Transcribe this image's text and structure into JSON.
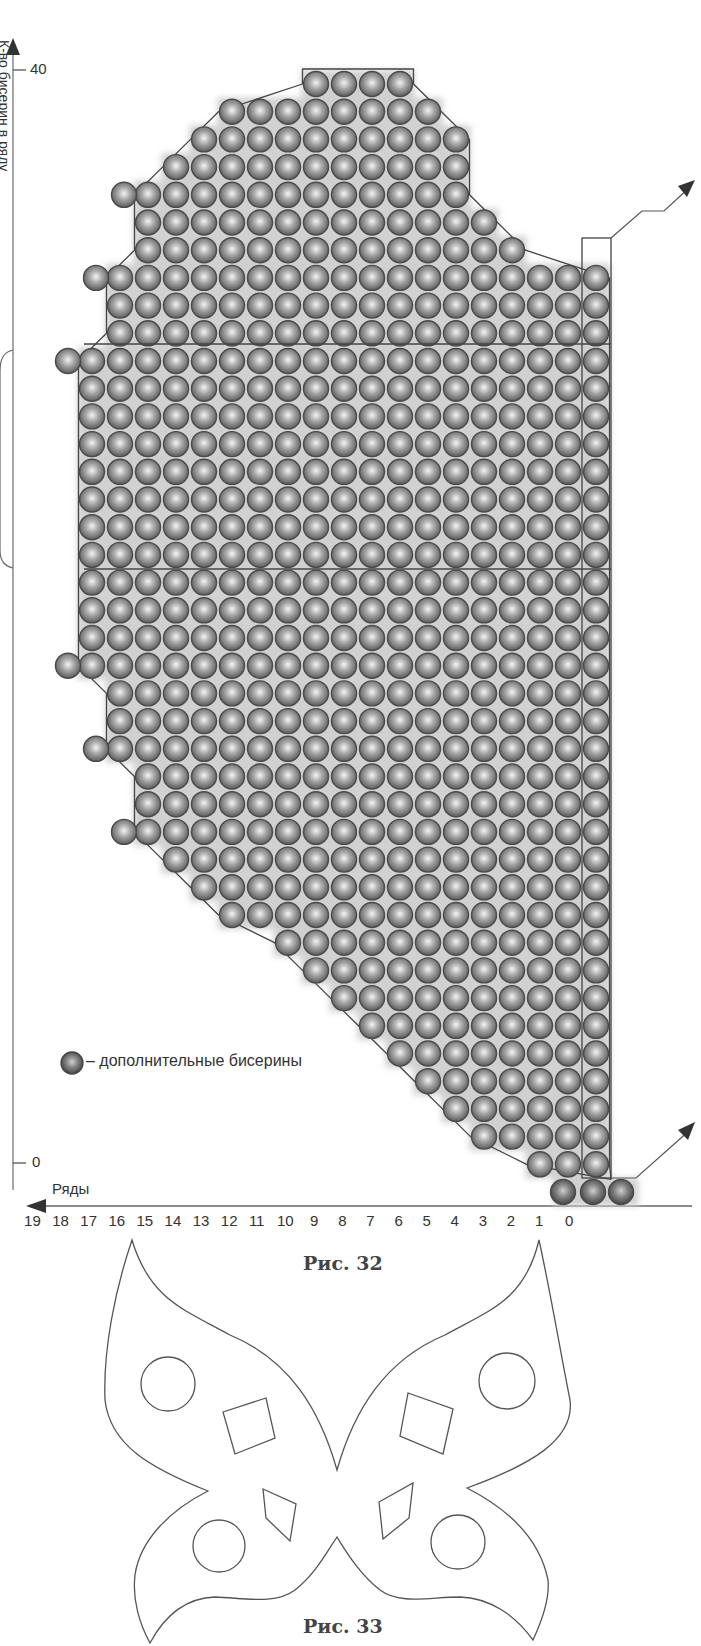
{
  "figure32": {
    "caption": "Рис. 32",
    "y_axis": {
      "label": "К-во бисерин в ряду",
      "tick_top": "40",
      "tick_bottom": "0"
    },
    "x_axis": {
      "label": "Ряды",
      "ticks": [
        "19",
        "18",
        "17",
        "16",
        "15",
        "14",
        "13",
        "12",
        "11",
        "10",
        "9",
        "8",
        "7",
        "6",
        "5",
        "4",
        "3",
        "2",
        "1",
        "0"
      ]
    },
    "legend": {
      "text": "– дополнительные бисерины"
    },
    "colors": {
      "bead": "#8a8a8a",
      "bead_highlight": "#f2f2f2",
      "bead_shadow": "#555555",
      "outline": "#444444",
      "extra_bead": "#6e6e6e"
    }
  },
  "figure33": {
    "caption": "Рис. 33"
  },
  "chart_data": {
    "type": "table",
    "xlabel": "Ряды",
    "ylabel": "К-во бисерин в ряду",
    "ylim": [
      0,
      40
    ],
    "grid_rows_top_to_bottom": [
      {
        "row": 40,
        "from_col": 7,
        "to_col": 10
      },
      {
        "row": 39,
        "from_col": 6,
        "to_col": 13
      },
      {
        "row": 38,
        "from_col": 5,
        "to_col": 14
      },
      {
        "row": 37,
        "from_col": 5,
        "to_col": 15
      },
      {
        "row": 36,
        "from_col": 5,
        "to_col": 16,
        "extra_left": true
      },
      {
        "row": 35,
        "from_col": 4,
        "to_col": 16
      },
      {
        "row": 34,
        "from_col": 3,
        "to_col": 16
      },
      {
        "row": 33,
        "from_col": 0,
        "to_col": 17,
        "extra_left": true
      },
      {
        "row": 32,
        "from_col": 0,
        "to_col": 17
      },
      {
        "row": 31,
        "from_col": 0,
        "to_col": 17
      },
      {
        "row": 30,
        "from_col": 0,
        "to_col": 18,
        "extra_left": true
      },
      {
        "row": 29,
        "from_col": 0,
        "to_col": 18
      },
      {
        "row": 28,
        "from_col": 0,
        "to_col": 18
      },
      {
        "row": 27,
        "from_col": 0,
        "to_col": 18
      },
      {
        "row": 26,
        "from_col": 0,
        "to_col": 18
      },
      {
        "row": 25,
        "from_col": 0,
        "to_col": 18
      },
      {
        "row": 24,
        "from_col": 0,
        "to_col": 18
      },
      {
        "row": 23,
        "from_col": 0,
        "to_col": 18
      },
      {
        "row": 22,
        "from_col": 0,
        "to_col": 18
      },
      {
        "row": 21,
        "from_col": 0,
        "to_col": 18
      },
      {
        "row": 20,
        "from_col": 0,
        "to_col": 18
      },
      {
        "row": 19,
        "from_col": 0,
        "to_col": 18,
        "extra_left": true
      },
      {
        "row": 18,
        "from_col": 0,
        "to_col": 17
      },
      {
        "row": 17,
        "from_col": 0,
        "to_col": 17
      },
      {
        "row": 16,
        "from_col": 0,
        "to_col": 17,
        "extra_left": true
      },
      {
        "row": 15,
        "from_col": 0,
        "to_col": 16
      },
      {
        "row": 14,
        "from_col": 0,
        "to_col": 16
      },
      {
        "row": 13,
        "from_col": 0,
        "to_col": 16,
        "extra_left": true
      },
      {
        "row": 12,
        "from_col": 0,
        "to_col": 15
      },
      {
        "row": 11,
        "from_col": 0,
        "to_col": 14
      },
      {
        "row": 10,
        "from_col": 0,
        "to_col": 13
      },
      {
        "row": 9,
        "from_col": 0,
        "to_col": 11
      },
      {
        "row": 8,
        "from_col": 0,
        "to_col": 10
      },
      {
        "row": 7,
        "from_col": 0,
        "to_col": 9
      },
      {
        "row": 6,
        "from_col": 0,
        "to_col": 8
      },
      {
        "row": 5,
        "from_col": 0,
        "to_col": 7
      },
      {
        "row": 4,
        "from_col": 0,
        "to_col": 6
      },
      {
        "row": 3,
        "from_col": 0,
        "to_col": 5
      },
      {
        "row": 2,
        "from_col": 0,
        "to_col": 4
      },
      {
        "row": 1,
        "from_col": 0,
        "to_col": 2
      },
      {
        "row": 0,
        "from_col": -1,
        "to_col": 1,
        "extra_row": true
      }
    ],
    "dividers_after_rows": [
      33,
      20
    ],
    "legend": [
      "дополнительные бисерины"
    ]
  }
}
